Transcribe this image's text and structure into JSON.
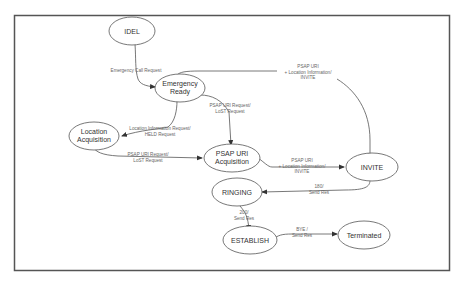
{
  "colors": {
    "stroke": "#555555",
    "frame": "#555555",
    "text": "#333333",
    "edge_text": "#666666"
  },
  "nodes": {
    "idel": {
      "label": "IDEL"
    },
    "emergency_ready": {
      "line1": "Emergency",
      "line2": "Ready"
    },
    "location_acquisition": {
      "line1": "Location",
      "line2": "Acquisition"
    },
    "psap_uri_acquisition": {
      "line1": "PSAP URI",
      "line2": "Acquisition"
    },
    "invite": {
      "label": "INVITE"
    },
    "ringing": {
      "label": "RINGING"
    },
    "establish": {
      "label": "ESTABLISH"
    },
    "terminated": {
      "label": "Terminated"
    }
  },
  "edges": {
    "idel_to_ready": {
      "line1": "Emergency Call Request"
    },
    "ready_to_invite": {
      "line1": "PSAP URI",
      "line2": "+ Location Information/",
      "line3": "INVITE"
    },
    "ready_to_psap": {
      "line1": "PSAP URI Request/",
      "line2": "LoST Request"
    },
    "ready_to_location": {
      "line1": "Location Information Request/",
      "line2": "HELD Request"
    },
    "location_to_psap": {
      "line1": "PSAP URI Request/",
      "line2": "LoST Request"
    },
    "psap_to_invite": {
      "line1": "PSAP URI",
      "line2": "+ Location Information/",
      "line3": "INVITE"
    },
    "invite_to_ringing": {
      "line1": "180/",
      "line2": "Send Res"
    },
    "ringing_to_establish": {
      "line1": "200/",
      "line2": "Send Res"
    },
    "establish_to_terminated": {
      "line1": "BYE /",
      "line2": "Send Res"
    }
  }
}
